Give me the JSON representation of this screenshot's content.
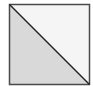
{
  "diagram": {
    "shape": "square-split-diagonal",
    "square": {
      "x": 9.5,
      "y": 4.5,
      "size": 80
    },
    "colors": {
      "border": "#4a4a4a",
      "diagonal": "#222222",
      "lower_left_fill": "#d9d9d9",
      "upper_right_fill": "#f5f5f5"
    }
  }
}
